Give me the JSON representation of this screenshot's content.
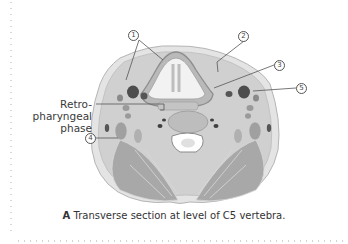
{
  "figure": {
    "caption_letter": "A",
    "caption_text": "Transverse section at level of C5 vertebra.",
    "labels": {
      "retro": "Retro-",
      "pharyngeal": "pharyngeal",
      "phase": "phase"
    },
    "callouts": [
      "1",
      "2",
      "3",
      "4",
      "5"
    ],
    "colors": {
      "tissue": "#c8c8c8",
      "muscle": "#a9a9a9",
      "skin": "#e2e2e2",
      "vessel": "#4a4a4a",
      "border_dots": "#c0c0c0"
    }
  }
}
